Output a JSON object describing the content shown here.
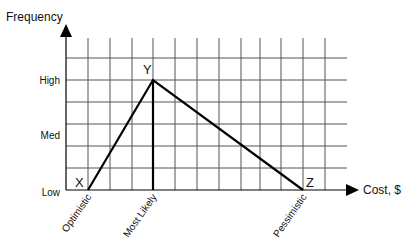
{
  "diagram": {
    "type": "triangular-distribution",
    "y_axis_title": "Frequency",
    "x_axis_title": "Cost, $",
    "y_levels": [
      {
        "label": "High",
        "y": 80
      },
      {
        "label": "Med",
        "y": 135
      },
      {
        "label": "Low",
        "y": 192
      }
    ],
    "x_labels": [
      {
        "label": "Optimistic",
        "x": 88
      },
      {
        "label": "Most Likely",
        "x": 153
      },
      {
        "label": "Pessimistic",
        "x": 303
      }
    ],
    "points": {
      "X": {
        "label": "X",
        "x": 88,
        "y": 190
      },
      "Y": {
        "label": "Y",
        "x": 153,
        "y": 80
      },
      "Z": {
        "label": "Z",
        "x": 303,
        "y": 190
      }
    },
    "grid": {
      "x0": 66,
      "x1": 347,
      "y_top": 38,
      "y_base": 190,
      "v_lines": [
        88,
        110,
        132,
        153,
        175,
        197,
        219,
        241,
        260,
        281,
        303,
        325
      ],
      "h_lines": [
        58,
        80,
        102,
        124,
        146,
        168
      ]
    },
    "colors": {
      "grid": "#555555",
      "line": "#000000",
      "text": "#111111"
    }
  }
}
